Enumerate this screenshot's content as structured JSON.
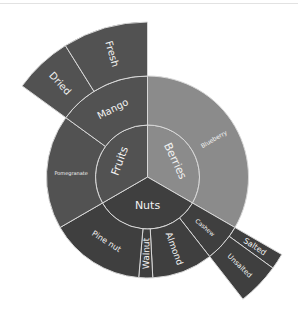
{
  "chart_data": {
    "type": "sunburst",
    "title": "",
    "center": [
      147.5,
      177
    ],
    "radii": [
      0,
      52,
      101,
      155
    ],
    "colors": {
      "Fruits": "#525252",
      "Berries": "#8b8b8b",
      "Nuts": "#3f3f3f",
      "separator": "#d8d8d8",
      "text": "#f2f2f2"
    },
    "nodes": [
      {
        "name": "Berries",
        "level": 1,
        "start": 0,
        "end": 120,
        "color": "Berries",
        "font": 11
      },
      {
        "name": "Nuts",
        "level": 1,
        "start": 120,
        "end": 240,
        "color": "Nuts",
        "font": 11,
        "horizontal": true
      },
      {
        "name": "Fruits",
        "level": 1,
        "start": 240,
        "end": 360,
        "color": "Fruits",
        "font": 11
      },
      {
        "name": "Blueberry",
        "parent": "Berries",
        "level": 2,
        "start": 0,
        "end": 120,
        "color": "Berries",
        "font": 6
      },
      {
        "name": "Cashew",
        "parent": "Nuts",
        "level": 2,
        "start": 120,
        "end": 142,
        "color": "Nuts",
        "font": 6
      },
      {
        "name": "Almond",
        "parent": "Nuts",
        "level": 2,
        "start": 142,
        "end": 177,
        "color": "Nuts",
        "font": 9
      },
      {
        "name": "Walnut",
        "parent": "Nuts",
        "level": 2,
        "start": 177,
        "end": 185,
        "color": "Nuts",
        "font": 9
      },
      {
        "name": "Pine nut",
        "parent": "Nuts",
        "level": 2,
        "start": 185,
        "end": 240,
        "color": "Nuts",
        "font": 8
      },
      {
        "name": "Pomegranate",
        "parent": "Fruits",
        "level": 2,
        "start": 240,
        "end": 306,
        "color": "Fruits",
        "font": 5
      },
      {
        "name": "Mango",
        "parent": "Fruits",
        "level": 2,
        "start": 306,
        "end": 360,
        "color": "Fruits",
        "font": 10
      },
      {
        "name": "Salted",
        "parent": "Cashew",
        "level": 3,
        "start": 120,
        "end": 126,
        "color": "Nuts",
        "font": 8
      },
      {
        "name": "Unsalted",
        "parent": "Cashew",
        "level": 3,
        "start": 126,
        "end": 142,
        "color": "Nuts",
        "font": 7
      },
      {
        "name": "Dried",
        "parent": "Mango",
        "level": 3,
        "start": 306,
        "end": 328,
        "color": "Fruits",
        "font": 10
      },
      {
        "name": "Fresh",
        "parent": "Mango",
        "level": 3,
        "start": 328,
        "end": 360,
        "color": "Fruits",
        "font": 10
      }
    ]
  }
}
